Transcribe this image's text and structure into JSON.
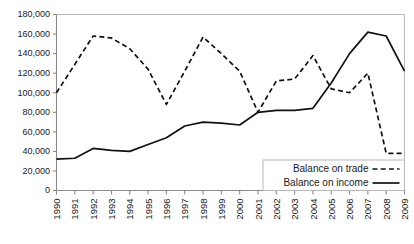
{
  "chart_data": {
    "type": "line",
    "title": "",
    "xlabel": "",
    "ylabel": "",
    "grid": false,
    "legend_position": "bottom-right",
    "ylim": [
      0,
      180000
    ],
    "ytick_step": 20000,
    "ytick_labels": [
      "0",
      "20,000",
      "40,000",
      "60,000",
      "80,000",
      "100,000",
      "120,000",
      "140,000",
      "160,000",
      "180,000"
    ],
    "ytick_values": [
      0,
      20000,
      40000,
      60000,
      80000,
      100000,
      120000,
      140000,
      160000,
      180000
    ],
    "categories": [
      "1990",
      "1991",
      "1992",
      "1993",
      "1994",
      "1995",
      "1996",
      "1997",
      "1998",
      "1999",
      "2000",
      "2001",
      "2002",
      "2003",
      "2004",
      "2005",
      "2006",
      "2007",
      "2008",
      "2009"
    ],
    "x": [
      1990,
      1991,
      1992,
      1993,
      1994,
      1995,
      1996,
      1997,
      1998,
      1999,
      2000,
      2001,
      2002,
      2003,
      2004,
      2005,
      2006,
      2007,
      2008,
      2009
    ],
    "series": [
      {
        "name": "Balance on trade",
        "style": "dashed",
        "color": "#111111",
        "values": [
          100000,
          129000,
          158000,
          156000,
          145000,
          124000,
          88000,
          122000,
          157000,
          140000,
          122000,
          80000,
          112000,
          114000,
          138000,
          104000,
          100000,
          120000,
          38000,
          38000
        ]
      },
      {
        "name": "Balance on income",
        "style": "solid",
        "color": "#111111",
        "values": [
          32000,
          33000,
          43000,
          41000,
          40000,
          47000,
          54000,
          66000,
          70000,
          69000,
          67000,
          80000,
          82000,
          82000,
          84000,
          110000,
          140000,
          162000,
          158000,
          122000
        ]
      }
    ],
    "legend_entries": [
      {
        "label": "Balance on trade",
        "style": "dashed"
      },
      {
        "label": "Balance on  income",
        "style": "solid"
      }
    ]
  }
}
